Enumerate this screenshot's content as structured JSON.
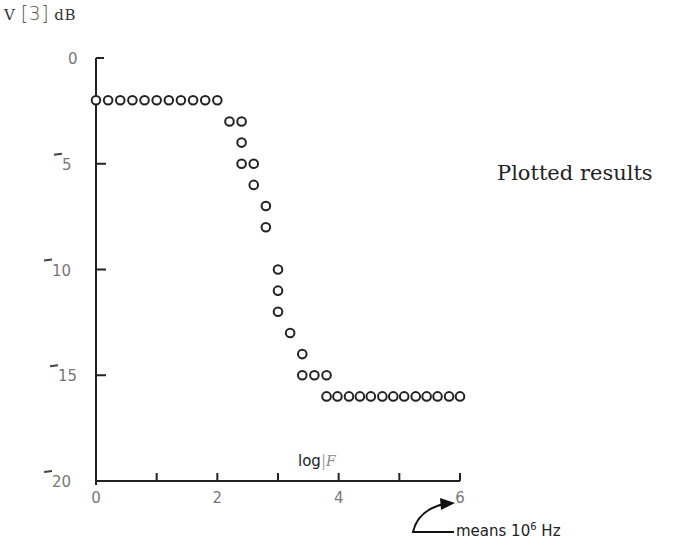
{
  "chart_data": {
    "type": "scatter",
    "title": "",
    "ylabel": "V [3] dB",
    "xlabel": "log F",
    "side_annotation": "Plotted results",
    "x_note": "means 10^6 Hz",
    "xlim": [
      0,
      6
    ],
    "ylim": [
      -20,
      0
    ],
    "grid": false,
    "x_ticks": [
      0,
      1,
      2,
      3,
      4,
      5,
      6
    ],
    "x_tick_labels": [
      "0",
      "2",
      "4",
      "6"
    ],
    "y_tick_labels": [
      "0",
      "-5",
      "-10",
      "-15",
      "-20"
    ],
    "marker": "open-circle",
    "series": [
      {
        "name": "Plotted results",
        "points": [
          [
            0.0,
            -2
          ],
          [
            0.2,
            -2
          ],
          [
            0.4,
            -2
          ],
          [
            0.6,
            -2
          ],
          [
            0.8,
            -2
          ],
          [
            1.0,
            -2
          ],
          [
            1.2,
            -2
          ],
          [
            1.4,
            -2
          ],
          [
            1.6,
            -2
          ],
          [
            1.8,
            -2
          ],
          [
            2.0,
            -2
          ],
          [
            2.2,
            -3
          ],
          [
            2.4,
            -3
          ],
          [
            2.4,
            -4
          ],
          [
            2.4,
            -5
          ],
          [
            2.6,
            -5
          ],
          [
            2.6,
            -6
          ],
          [
            2.8,
            -7
          ],
          [
            2.8,
            -8
          ],
          [
            3.0,
            -10
          ],
          [
            3.0,
            -11
          ],
          [
            3.0,
            -12
          ],
          [
            3.2,
            -13
          ],
          [
            3.4,
            -14
          ],
          [
            3.4,
            -15
          ],
          [
            3.6,
            -15
          ],
          [
            3.8,
            -15
          ],
          [
            3.8,
            -16
          ],
          [
            3.98,
            -16
          ],
          [
            4.17,
            -16
          ],
          [
            4.35,
            -16
          ],
          [
            4.53,
            -16
          ],
          [
            4.72,
            -16
          ],
          [
            4.9,
            -16
          ],
          [
            5.08,
            -16
          ],
          [
            5.27,
            -16
          ],
          [
            5.45,
            -16
          ],
          [
            5.63,
            -16
          ],
          [
            5.82,
            -16
          ],
          [
            6.0,
            -16
          ]
        ]
      }
    ]
  },
  "labels": {
    "y_title_v": "V",
    "y_title_bracket": "[3]",
    "y_title_unit": "dB",
    "x_title_log": "log",
    "x_title_f": "F",
    "side_note": "Plotted results",
    "note_prefix": "means 10",
    "note_exp": "6",
    "note_suffix": " Hz"
  }
}
